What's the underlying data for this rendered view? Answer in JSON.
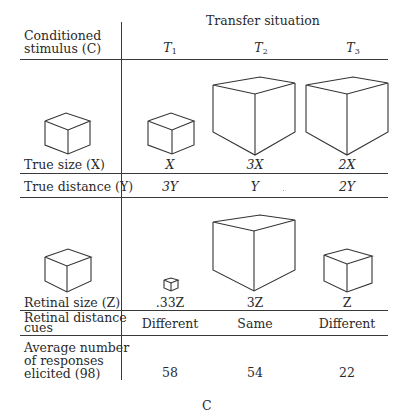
{
  "table": {
    "corner_header": [
      "Conditioned",
      "stimulus (C)"
    ],
    "group_header": "Transfer situation",
    "columns": [
      {
        "label": "T",
        "sub": "1"
      },
      {
        "label": "T",
        "sub": "2"
      },
      {
        "label": "T",
        "sub": "3"
      }
    ],
    "rows": [
      {
        "label": "True size (X)",
        "values": [
          "X",
          "3X",
          "2X"
        ]
      },
      {
        "label": "True distance (Y)",
        "values": [
          "3Y",
          "Y",
          "2Y"
        ]
      },
      {
        "label": "Retinal size (Z)",
        "values": [
          ".33Z",
          "3Z",
          "Z"
        ]
      },
      {
        "label": [
          "Retinal distance",
          "cues"
        ],
        "values": [
          "Different",
          "Same",
          "Different"
        ]
      },
      {
        "label": [
          "Average number",
          "of responses",
          "elicited (98)"
        ],
        "values": [
          "58",
          "54",
          "22"
        ]
      }
    ]
  },
  "caption": "C"
}
